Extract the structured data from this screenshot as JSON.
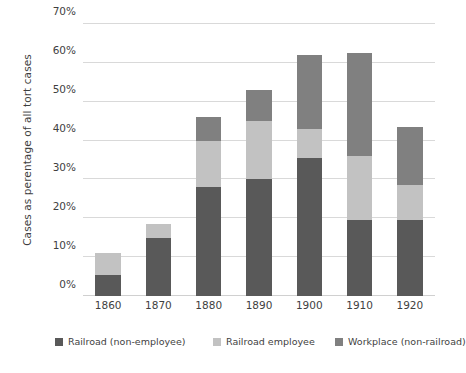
{
  "chart_data": {
    "type": "bar",
    "subtype": "stacked-bar-vertical",
    "title": "",
    "subtitle": "",
    "xlabel": "",
    "ylabel": "Cases as perentage of all tort cases",
    "categories": [
      "1860",
      "1870",
      "1880",
      "1890",
      "1900",
      "1910",
      "1920"
    ],
    "series": [
      {
        "name": "Railroad (non-employee)",
        "color": "#595959",
        "values": [
          5.5,
          15.0,
          28.0,
          30.2,
          35.5,
          19.5,
          19.5
        ]
      },
      {
        "name": "Railroad employee",
        "color": "#c2c2c2",
        "values": [
          5.7,
          3.5,
          12.0,
          14.8,
          7.5,
          16.5,
          9.0
        ]
      },
      {
        "name": "Workplace (non-railroad)",
        "color": "#808080",
        "values": [
          0.0,
          0.0,
          6.0,
          8.0,
          19.0,
          26.5,
          15.0
        ]
      }
    ],
    "totals": [
      11.2,
      18.5,
      46.0,
      53.0,
      62.0,
      62.5,
      43.5
    ],
    "ylim": [
      0,
      70
    ],
    "ytick_step": 10,
    "ytick_labels": [
      "0%",
      "10%",
      "20%",
      "30%",
      "40%",
      "50%",
      "60%",
      "70%"
    ],
    "ytick_values": [
      0,
      10,
      20,
      30,
      40,
      50,
      60,
      70
    ],
    "grid": {
      "horizontal": true,
      "vertical": false,
      "color": "#d9d9d9"
    },
    "legend": {
      "position": "bottom",
      "orientation": "horizontal",
      "entries": [
        {
          "label": "Railroad (non-employee)",
          "color": "#595959"
        },
        {
          "label": "Railroad employee",
          "color": "#c2c2c2"
        },
        {
          "label": "Workplace (non-railroad)",
          "color": "#808080"
        }
      ]
    },
    "background_color": "#ffffff",
    "text_color": "#3f3f3f"
  }
}
